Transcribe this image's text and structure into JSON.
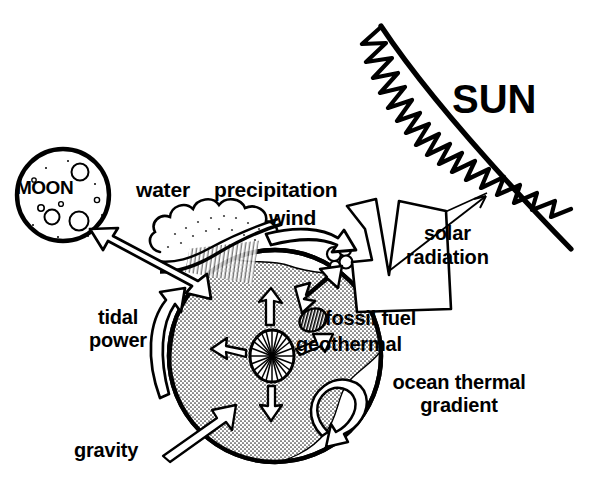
{
  "diagram": {
    "background_color": "#ffffff",
    "ink_color": "#000000",
    "land_fill_color": "#d9d9d9",
    "labels": {
      "sun": "SUN",
      "moon": "MOON",
      "water": "water",
      "precipitation": "precipitation",
      "wind": "wind",
      "solar_radiation_line1": "solar",
      "solar_radiation_line2": "radiation",
      "tidal_power_line1": "tidal",
      "tidal_power_line2": "power",
      "fossil_fuel": "fossil fuel",
      "geothermal": "geothermal",
      "ocean_thermal_line1": "ocean thermal",
      "ocean_thermal_line2": "gradient",
      "gravity": "gravity"
    },
    "elements": {
      "sun_body": "sun-arc-with-flames",
      "moon_body": "moon-circle-with-craters",
      "earth_body": "earth-globe-with-landmass",
      "cloud": "cloud-with-rain",
      "geothermal_core": "radiating-core-sunburst",
      "fossil_fuel_deposit": "hatched-ellipse-deposit",
      "ocean_loop": "ocean-circulation-loop-arrow",
      "wind_arrow": "curved-wind-arrow",
      "tidal_arrow": "curved-tidal-arrow",
      "moon_earth_arrow": "double-headed-tidal-arrow",
      "gravity_arrow": "thin-gravity-arrow",
      "solar_beam": "broad-solar-radiation-beam"
    }
  }
}
